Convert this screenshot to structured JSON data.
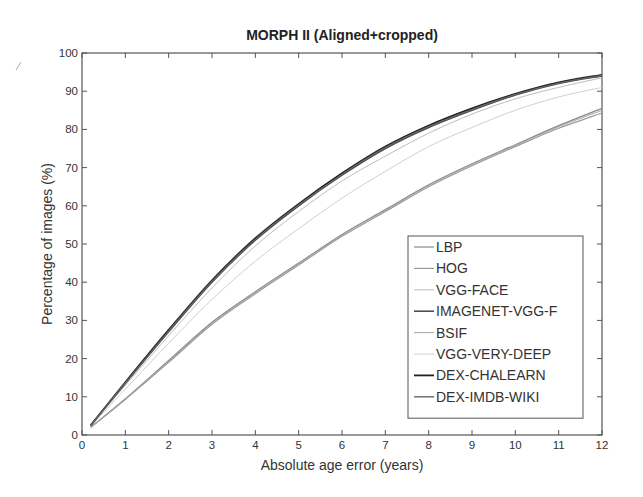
{
  "chart_data": {
    "type": "line",
    "title": "MORPH II  (Aligned+cropped)",
    "xlabel": "Absolute age error (years)",
    "ylabel": "Percentage of images (%)",
    "xlim": [
      0,
      12
    ],
    "ylim": [
      0,
      100
    ],
    "xticks": [
      0,
      1,
      2,
      3,
      4,
      5,
      6,
      7,
      8,
      9,
      10,
      11,
      12
    ],
    "yticks": [
      0,
      10,
      20,
      30,
      40,
      50,
      60,
      70,
      80,
      90,
      100
    ],
    "grid": false,
    "legend_position": "lower right",
    "x": [
      0.2,
      1,
      2,
      3,
      4,
      5,
      6,
      7,
      8,
      9,
      10,
      11,
      12
    ],
    "series": [
      {
        "name": "LBP",
        "color": "#8a8a8a",
        "width": 1.2,
        "values": [
          2.0,
          9.5,
          19.5,
          29.5,
          37.5,
          45.0,
          52.5,
          59.0,
          65.5,
          71.0,
          76.0,
          81.0,
          85.5
        ]
      },
      {
        "name": "HOG",
        "color": "#9a9a9a",
        "width": 1.2,
        "values": [
          2.0,
          9.3,
          19.0,
          29.0,
          37.0,
          44.5,
          52.0,
          58.5,
          65.0,
          70.5,
          75.5,
          80.3,
          84.3
        ]
      },
      {
        "name": "VGG-FACE",
        "color": "#bdbdbd",
        "width": 1.0,
        "values": [
          2.5,
          13.0,
          26.0,
          38.5,
          49.5,
          58.5,
          66.5,
          73.0,
          79.0,
          84.0,
          88.0,
          91.0,
          93.5
        ]
      },
      {
        "name": "IMAGENET-VGG-F",
        "color": "#444444",
        "width": 1.5,
        "values": [
          2.5,
          13.5,
          27.0,
          40.0,
          51.0,
          60.0,
          68.0,
          75.0,
          80.5,
          85.0,
          89.0,
          92.0,
          94.0
        ]
      },
      {
        "name": "BSIF",
        "color": "#a5a5a5",
        "width": 1.0,
        "values": [
          2.0,
          9.4,
          19.3,
          29.2,
          37.3,
          44.8,
          52.3,
          58.8,
          65.3,
          70.8,
          75.8,
          80.7,
          85.0
        ]
      },
      {
        "name": "VGG-VERY-DEEP",
        "color": "#cfcfcf",
        "width": 1.0,
        "values": [
          2.3,
          12.0,
          24.0,
          35.5,
          45.5,
          54.0,
          62.0,
          69.0,
          75.5,
          80.5,
          85.0,
          88.5,
          91.0
        ]
      },
      {
        "name": "DEX-CHALEARN",
        "color": "#222222",
        "width": 1.8,
        "values": [
          2.5,
          13.8,
          27.5,
          40.5,
          51.5,
          60.5,
          68.5,
          75.5,
          81.0,
          85.5,
          89.3,
          92.3,
          94.3
        ]
      },
      {
        "name": "DEX-IMDB-WIKI",
        "color": "#666666",
        "width": 1.4,
        "values": [
          2.5,
          13.6,
          27.2,
          40.2,
          51.2,
          60.2,
          68.2,
          75.2,
          80.7,
          85.2,
          89.1,
          92.1,
          94.1
        ]
      }
    ]
  }
}
